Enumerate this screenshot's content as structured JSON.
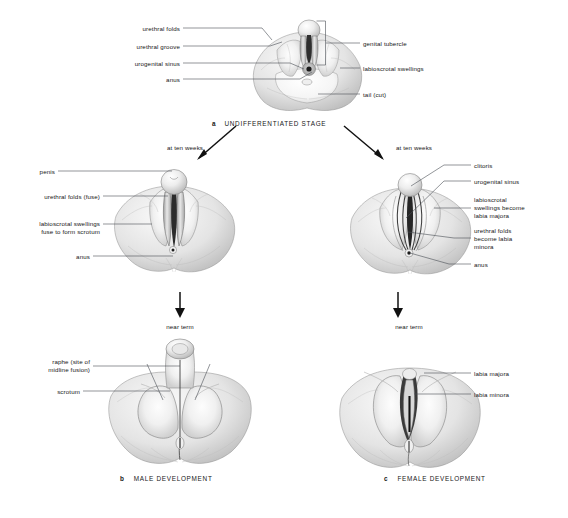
{
  "figure": {
    "background": "#ffffff",
    "ink": "#1a1a1a",
    "leader_color": "#4a4f55"
  },
  "panels": {
    "undifferentiated": {
      "caption_letter": "a",
      "caption_text": "UNDIFFERENTIATED STAGE",
      "labels_left": [
        "urethral folds",
        "urethral groove",
        "urogenital sinus",
        "anus"
      ],
      "labels_right": [
        "genital tubercle",
        "labioscrotal swellings",
        "tail (cut)"
      ]
    },
    "male_ten_weeks": {
      "stage_text": "at ten weeks",
      "labels_left": [
        "penis",
        "urethral folds (fuse)",
        "labioscrotal swellings\nfuse to form scrotum",
        "anus"
      ]
    },
    "female_ten_weeks": {
      "stage_text": "at ten weeks",
      "labels_right": [
        "clitoris",
        "urogenital sinus",
        "labioscrotal\nswellings become\nlabia majora",
        "urethral folds\nbecome labia\nminora",
        "anus"
      ]
    },
    "male_near_term": {
      "stage_text": "near term",
      "labels_left": [
        "raphe (site of\nmidline fusion)",
        "scrotum"
      ],
      "caption_letter": "b",
      "caption_text": "MALE DEVELOPMENT"
    },
    "female_near_term": {
      "stage_text": "near term",
      "labels_right": [
        "labia majora",
        "labia minora"
      ],
      "caption_letter": "c",
      "caption_text": "FEMALE DEVELOPMENT"
    }
  }
}
